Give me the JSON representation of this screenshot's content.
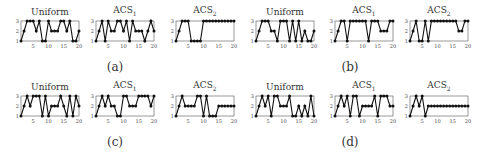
{
  "figure": {
    "panels": [
      {
        "caption": "(a)"
      },
      {
        "caption": "(b)"
      },
      {
        "caption": "(c)"
      },
      {
        "caption": "(d)"
      }
    ]
  },
  "chart_data": [
    {
      "panel": "(a)",
      "type": "line",
      "title": "Uniform",
      "x": [
        1,
        2,
        3,
        4,
        5,
        6,
        7,
        8,
        9,
        10,
        11,
        12,
        13,
        14,
        15,
        16,
        17,
        18,
        19,
        20
      ],
      "values": [
        1,
        2,
        3,
        3,
        3,
        2,
        3,
        1,
        1,
        3,
        2,
        2,
        2,
        3,
        3,
        2,
        3,
        1,
        1,
        2
      ],
      "xticks": [
        5,
        10,
        15,
        20
      ],
      "yticks": [
        1,
        2,
        3
      ],
      "ylim": [
        1,
        3
      ],
      "xlim": [
        1,
        20
      ]
    },
    {
      "panel": "(a)",
      "type": "line",
      "title": "ACS1",
      "x": [
        1,
        2,
        3,
        4,
        5,
        6,
        7,
        8,
        9,
        10,
        11,
        12,
        13,
        14,
        15,
        16,
        17,
        18,
        19,
        20
      ],
      "values": [
        1,
        2,
        3,
        1,
        3,
        2,
        2,
        3,
        3,
        2,
        3,
        1,
        3,
        2,
        2,
        2,
        1,
        2,
        3,
        2
      ],
      "xticks": [
        5,
        10,
        15,
        20
      ],
      "yticks": [
        1,
        2,
        3
      ],
      "ylim": [
        1,
        3
      ],
      "xlim": [
        1,
        20
      ]
    },
    {
      "panel": "(a)",
      "type": "line",
      "title": "ACS2",
      "x": [
        1,
        2,
        3,
        4,
        5,
        6,
        7,
        8,
        9,
        10,
        11,
        12,
        13,
        14,
        15,
        16,
        17,
        18,
        19,
        20
      ],
      "values": [
        1,
        2,
        3,
        3,
        3,
        1,
        1,
        1,
        1,
        3,
        3,
        3,
        3,
        3,
        3,
        3,
        3,
        3,
        3,
        3
      ],
      "xticks": [
        5,
        10,
        15,
        20
      ],
      "yticks": [
        1,
        2,
        3
      ],
      "ylim": [
        1,
        3
      ],
      "xlim": [
        1,
        20
      ]
    },
    {
      "panel": "(b)",
      "type": "line",
      "title": "Uniform",
      "x": [
        1,
        2,
        3,
        4,
        5,
        6,
        7,
        8,
        9,
        10,
        11,
        12,
        13,
        14,
        15,
        16,
        17,
        18,
        19,
        20
      ],
      "values": [
        1,
        2,
        3,
        3,
        3,
        2,
        2,
        1,
        3,
        3,
        3,
        1,
        3,
        1,
        3,
        1,
        2,
        1,
        1,
        2
      ],
      "xticks": [
        5,
        10,
        15,
        20
      ],
      "yticks": [
        1,
        2,
        3
      ],
      "ylim": [
        1,
        3
      ],
      "xlim": [
        1,
        20
      ]
    },
    {
      "panel": "(b)",
      "type": "line",
      "title": "ACS1",
      "x": [
        1,
        2,
        3,
        4,
        5,
        6,
        7,
        8,
        9,
        10,
        11,
        12,
        13,
        14,
        15,
        16,
        17,
        18,
        19,
        20
      ],
      "values": [
        1,
        2,
        3,
        3,
        1,
        3,
        3,
        3,
        3,
        3,
        3,
        1,
        3,
        3,
        3,
        2,
        2,
        2,
        3,
        3
      ],
      "xticks": [
        5,
        10,
        15,
        20
      ],
      "yticks": [
        1,
        2,
        3
      ],
      "ylim": [
        1,
        3
      ],
      "xlim": [
        1,
        20
      ]
    },
    {
      "panel": "(b)",
      "type": "line",
      "title": "ACS2",
      "x": [
        1,
        2,
        3,
        4,
        5,
        6,
        7,
        8,
        9,
        10,
        11,
        12,
        13,
        14,
        15,
        16,
        17,
        18,
        19,
        20
      ],
      "values": [
        1,
        2,
        3,
        1,
        1,
        3,
        1,
        3,
        3,
        3,
        3,
        3,
        3,
        3,
        3,
        3,
        2,
        2,
        3,
        3
      ],
      "xticks": [
        5,
        10,
        15,
        20
      ],
      "yticks": [
        1,
        2,
        3
      ],
      "ylim": [
        1,
        3
      ],
      "xlim": [
        1,
        20
      ]
    },
    {
      "panel": "(c)",
      "type": "line",
      "title": "Uniform",
      "x": [
        1,
        2,
        3,
        4,
        5,
        6,
        7,
        8,
        9,
        10,
        11,
        12,
        13,
        14,
        15,
        16,
        17,
        18,
        19,
        20
      ],
      "values": [
        1,
        2,
        3,
        2,
        3,
        3,
        3,
        1,
        3,
        1,
        2,
        2,
        2,
        3,
        2,
        1,
        3,
        1,
        3,
        2
      ],
      "xticks": [
        5,
        10,
        15,
        20
      ],
      "yticks": [
        1,
        2,
        3
      ],
      "ylim": [
        1,
        3
      ],
      "xlim": [
        1,
        20
      ]
    },
    {
      "panel": "(c)",
      "type": "line",
      "title": "ACS1",
      "x": [
        1,
        2,
        3,
        4,
        5,
        6,
        7,
        8,
        9,
        10,
        11,
        12,
        13,
        14,
        15,
        16,
        17,
        18,
        19,
        20
      ],
      "values": [
        1,
        2,
        3,
        2,
        3,
        2,
        2,
        1,
        1,
        3,
        3,
        2,
        2,
        2,
        3,
        3,
        3,
        3,
        2,
        3
      ],
      "xticks": [
        5,
        10,
        15,
        20
      ],
      "yticks": [
        1,
        2,
        3
      ],
      "ylim": [
        1,
        3
      ],
      "xlim": [
        1,
        20
      ]
    },
    {
      "panel": "(c)",
      "type": "line",
      "title": "ACS2",
      "x": [
        1,
        2,
        3,
        4,
        5,
        6,
        7,
        8,
        9,
        10,
        11,
        12,
        13,
        14,
        15,
        16,
        17,
        18,
        19,
        20
      ],
      "values": [
        1,
        2,
        3,
        2,
        2,
        2,
        2,
        3,
        3,
        1,
        3,
        1,
        1,
        1,
        2,
        2,
        2,
        2,
        2,
        2
      ],
      "xticks": [
        5,
        10,
        15,
        20
      ],
      "yticks": [
        1,
        2,
        3
      ],
      "ylim": [
        1,
        3
      ],
      "xlim": [
        1,
        20
      ]
    },
    {
      "panel": "(d)",
      "type": "line",
      "title": "Uniform",
      "x": [
        1,
        2,
        3,
        4,
        5,
        6,
        7,
        8,
        9,
        10,
        11,
        12,
        13,
        14,
        15,
        16,
        17,
        18,
        19,
        20
      ],
      "values": [
        1,
        2,
        3,
        2,
        3,
        1,
        3,
        3,
        2,
        2,
        2,
        3,
        1,
        1,
        2,
        1,
        2,
        1,
        3,
        1
      ],
      "xticks": [
        5,
        10,
        15,
        20
      ],
      "yticks": [
        1,
        2,
        3
      ],
      "ylim": [
        1,
        3
      ],
      "xlim": [
        1,
        20
      ]
    },
    {
      "panel": "(d)",
      "type": "line",
      "title": "ACS1",
      "x": [
        1,
        2,
        3,
        4,
        5,
        6,
        7,
        8,
        9,
        10,
        11,
        12,
        13,
        14,
        15,
        16,
        17,
        18,
        19,
        20
      ],
      "values": [
        1,
        2,
        3,
        2,
        3,
        1,
        3,
        3,
        1,
        2,
        2,
        2,
        2,
        3,
        1,
        3,
        3,
        3,
        2,
        2
      ],
      "xticks": [
        5,
        10,
        15,
        20
      ],
      "yticks": [
        1,
        2,
        3
      ],
      "ylim": [
        1,
        3
      ],
      "xlim": [
        1,
        20
      ]
    },
    {
      "panel": "(d)",
      "type": "line",
      "title": "ACS2",
      "x": [
        1,
        2,
        3,
        4,
        5,
        6,
        7,
        8,
        9,
        10,
        11,
        12,
        13,
        14,
        15,
        16,
        17,
        18,
        19,
        20
      ],
      "values": [
        1,
        2,
        3,
        2,
        3,
        1,
        2,
        2,
        2,
        2,
        2,
        2,
        2,
        2,
        2,
        2,
        2,
        2,
        2,
        2
      ],
      "xticks": [
        5,
        10,
        15,
        20
      ],
      "yticks": [
        1,
        2,
        3
      ],
      "ylim": [
        1,
        3
      ],
      "xlim": [
        1,
        20
      ]
    }
  ]
}
